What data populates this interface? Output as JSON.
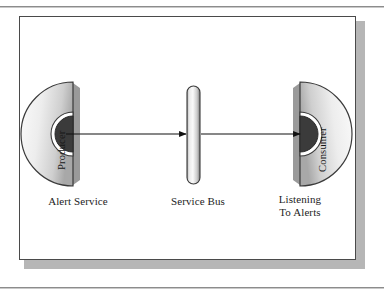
{
  "figure": {
    "type": "architecture-diagram",
    "nodes": [
      {
        "id": "producer",
        "shape": "half-circle-dome-right",
        "inner_label": "Producer",
        "caption": "Alert Service",
        "role": "publisher",
        "has_socket": true,
        "socket": "dark-semicircle-notch"
      },
      {
        "id": "service-bus",
        "shape": "vertical-rounded-bar",
        "inner_label": "",
        "caption": "Service Bus",
        "role": "message-bus",
        "has_socket": false
      },
      {
        "id": "consumer",
        "shape": "half-circle-dome-left",
        "inner_label": "Consumer",
        "caption_line1": "Listening",
        "caption_line2": "To Alerts",
        "role": "subscriber",
        "has_socket": true,
        "socket": "dark-semicircle-notch"
      }
    ],
    "connectors": [
      {
        "id": "producer-to-bus",
        "from": "producer",
        "to": "service-bus",
        "direction": "right",
        "arrowhead": "solid-triangle"
      },
      {
        "id": "bus-to-consumer",
        "from": "service-bus",
        "to": "consumer",
        "direction": "right",
        "arrowhead": "solid-triangle"
      }
    ],
    "colors": {
      "ink": "#1d1d1d",
      "outline": "#3a3a3a",
      "shape_light": "#fdfdfd",
      "shape_mid": "#d2d2d2",
      "shape_dark": "#8e8e8e",
      "socket": "#3b3b3b",
      "frame_border": "#4a4a4a",
      "frame_shadow": "#b6b6b6",
      "page": "#ffffff",
      "rule": "#8c8c8c"
    }
  }
}
